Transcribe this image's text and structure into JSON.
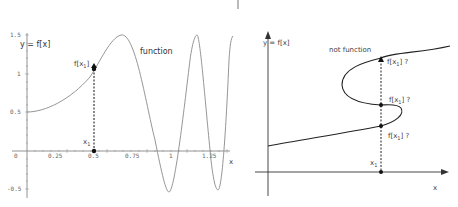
{
  "left_panel": {
    "title_label": "y = f[x]",
    "curve_label": "function",
    "point_label": "f[x",
    "point_label_sub": "1",
    "point_label_end": "]",
    "x1_label": "x",
    "x1_sub": "1",
    "x_axis_label": "x",
    "x_ticks": [
      "0",
      "0.25",
      "0.5",
      "0.75",
      "1",
      "1.25"
    ],
    "y_ticks": [
      "1.5",
      "1",
      "0.5",
      "-0.5"
    ]
  },
  "right_panel": {
    "title_label": "y = f[x]",
    "curve_label": "not function",
    "intersections": [
      {
        "label": "f[x",
        "sub": "1",
        "end": "] ?"
      },
      {
        "label": "f[x",
        "sub": "1",
        "end": "] ?"
      },
      {
        "label": "f[x",
        "sub": "1",
        "end": "] ?"
      }
    ],
    "x1_label": "x",
    "x1_sub": "1",
    "x_axis_label": "x"
  },
  "colors": {
    "curve_left": "#888888",
    "curve_right": "#333333",
    "axis": "#555555",
    "point": "#111111"
  }
}
